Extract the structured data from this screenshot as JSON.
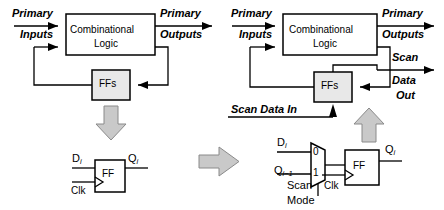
{
  "figure": {
    "type": "schematic-diagram",
    "colors": {
      "stroke": "#000000",
      "box_fill": "#ffffff",
      "ff_box_fill": "#e8e8e8",
      "block_arrow_fill": "#c9c9c9",
      "block_arrow_stroke": "#7a7a7a",
      "background": "#ffffff"
    }
  },
  "left_panel": {
    "name": "sequential-circuit-before-scan",
    "combinational_block": {
      "line1": "Combinational",
      "line2": "Logic"
    },
    "ff_block": {
      "label": "FFs"
    },
    "io_labels": {
      "primary_inputs_line1": "Primary",
      "primary_inputs_line2": "Inputs",
      "primary_outputs_line1": "Primary",
      "primary_outputs_line2": "Outputs"
    },
    "ff_detail": {
      "name": "plain-flip-flop",
      "body_label": "FF",
      "input_label": "D",
      "input_sub": "i",
      "output_label": "Q",
      "output_sub": "i",
      "clock_label": "Clk"
    }
  },
  "transform_arrow": {
    "name": "transform-arrow",
    "direction": "right"
  },
  "right_panel": {
    "name": "scan-circuit-after-conversion",
    "combinational_block": {
      "line1": "Combinational",
      "line2": "Logic"
    },
    "ff_block": {
      "label": "FFs"
    },
    "io_labels": {
      "primary_inputs_line1": "Primary",
      "primary_inputs_line2": "Inputs",
      "primary_outputs_line1": "Primary",
      "primary_outputs_line2": "Outputs",
      "scan_out_line1": "Scan",
      "scan_out_line2": "Data",
      "scan_out_line3": "Out",
      "scan_data_in": "Scan Data In"
    },
    "scan_ff_detail": {
      "name": "scan-flip-flop-with-mux",
      "body_label": "FF",
      "data_input_label": "D",
      "data_input_sub": "i",
      "scan_input_label": "Q",
      "scan_input_sub": "i−1",
      "mux_port_0": "0",
      "mux_port_1": "1",
      "select_line1": "Scan",
      "select_line2": "Mode",
      "output_label": "Q",
      "output_sub": "i",
      "clock_label": "Clk"
    }
  }
}
